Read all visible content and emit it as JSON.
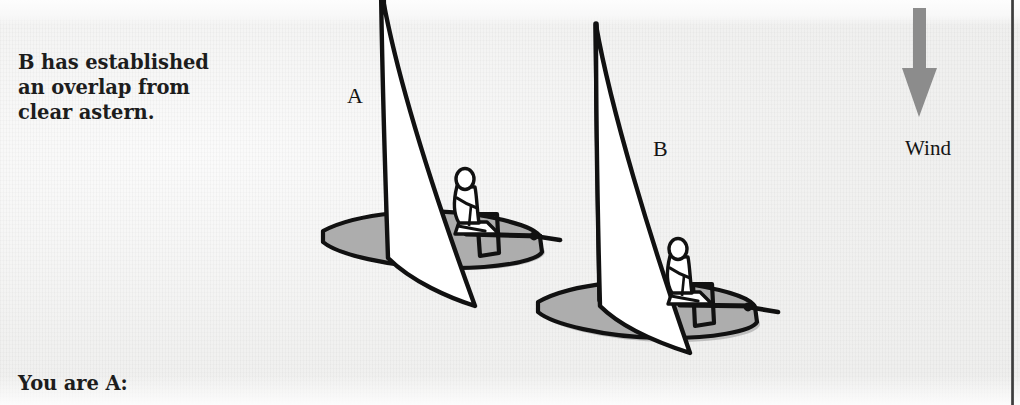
{
  "page": {
    "background_color": "#f3f3f2",
    "width": 1020,
    "height": 405
  },
  "captions": {
    "top": "B has established an overlap from clear astern.",
    "top_line1": "B has established",
    "top_line2": "an overlap from",
    "top_line3": "clear astern.",
    "bottom": "You are A:"
  },
  "labels": {
    "boat_a": "A",
    "boat_b": "B",
    "wind": "Wind"
  },
  "wind": {
    "direction": "down",
    "arrow_color": "#8c8c8c",
    "label": "Wind"
  },
  "colors": {
    "ink": "#111111",
    "sail_fill": "#ffffff",
    "hull_shadow": "#adadad",
    "water_shadow": "#b7b7b7",
    "arrow_gray": "#8c8c8c",
    "text": "#1d1d1d"
  },
  "diagram": {
    "type": "sailing-rules-illustration",
    "scene": "two dinghies on the same tack, boat B overlapped to leeward and astern of boat A, wind from the top of the page",
    "boats": [
      {
        "name": "A",
        "label": "A",
        "position": "upwind and ahead, left of centre",
        "parts": [
          "hull",
          "transom",
          "mast",
          "mainsail",
          "boom",
          "tiller",
          "sailor",
          "shadow"
        ]
      },
      {
        "name": "B",
        "label": "B",
        "position": "astern and to leeward, right of centre, lower on the page",
        "parts": [
          "hull",
          "transom",
          "mast",
          "mainsail",
          "boom",
          "tiller",
          "sailor",
          "shadow"
        ]
      }
    ]
  }
}
